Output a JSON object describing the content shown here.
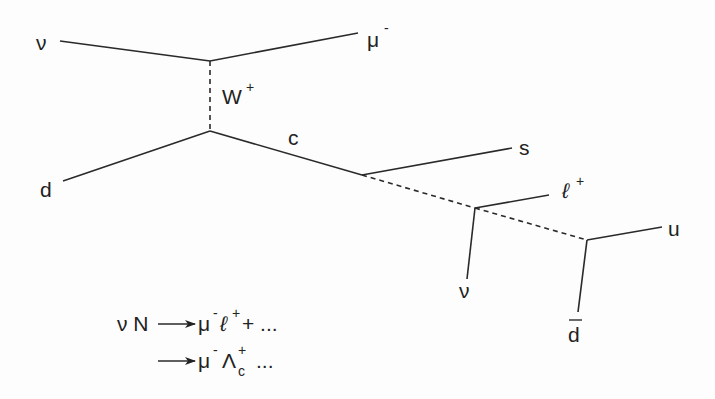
{
  "diagram": {
    "type": "feynman-diagram",
    "particles": {
      "incoming_neutrino": "ν",
      "outgoing_muon": "μ",
      "outgoing_muon_charge": "-",
      "boson": "W",
      "boson_charge": "+",
      "incoming_quark": "d",
      "charm_quark": "c",
      "strange_quark": "s",
      "lepton": "ℓ",
      "lepton_charge": "+",
      "decay_neutrino": "ν",
      "up_quark": "u",
      "anti_down_quark": "d"
    },
    "equations": {
      "line1_lhs": "ν N",
      "line1_rhs_muon": "μ",
      "line1_rhs_muon_charge": "-",
      "line1_rhs_lepton": "ℓ",
      "line1_rhs_lepton_charge": "+",
      "line1_rhs_tail": "+ ...",
      "line2_rhs_muon": "μ",
      "line2_rhs_muon_charge": "-",
      "line2_rhs_baryon": "Λ",
      "line2_rhs_baryon_charge": "+",
      "line2_rhs_baryon_sub": "c",
      "line2_rhs_tail": "..."
    }
  }
}
